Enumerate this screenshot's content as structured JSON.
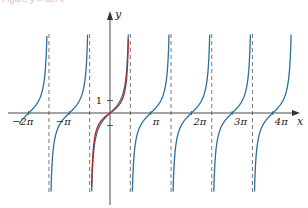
{
  "caption": "Figure  y = tan x",
  "chart_data": {
    "type": "line",
    "title": "",
    "xlabel": "x",
    "ylabel": "y",
    "x_tick_labels": [
      "−2π",
      "−π",
      "π",
      "2π",
      "3π",
      "4π"
    ],
    "x_tick_values": [
      -6.2832,
      -3.1416,
      3.1416,
      6.2832,
      9.4248,
      12.5664
    ],
    "y_tick_labels": [
      "1"
    ],
    "y_tick_values": [
      1
    ],
    "xlim": [
      -7.0,
      13.3
    ],
    "ylim": [
      -6,
      6
    ],
    "asymptotes_x": [
      -4.7124,
      -1.5708,
      1.5708,
      4.7124,
      7.854,
      10.9956
    ],
    "series": [
      {
        "name": "y = tan x",
        "color": "#2a6f9e",
        "function": "tan(x)",
        "domain": [
          -7.0,
          13.3
        ]
      },
      {
        "name": "restricted tan (principal branch)",
        "color": "#b22a2a",
        "function": "tan(x) on (-π/2, π/2)",
        "domain": [
          -1.5708,
          1.5708
        ]
      }
    ],
    "grid": false,
    "legend": "none"
  },
  "colors": {
    "blue_curve": "#2a6f9e",
    "red_curve": "#b22a2a",
    "axis": "#333333",
    "asymptote": "#555555"
  }
}
